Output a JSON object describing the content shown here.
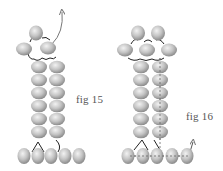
{
  "figures": [
    {
      "id": "fig15",
      "label": "fig 15",
      "description": "Two-column bead ladder with a 3-bead top cluster and 5-bead base row; thread exits upward from top right bead"
    },
    {
      "id": "fig16",
      "label": "fig 16",
      "description": "Two-column bead ladder with a 5-bead top cluster (2 over 3) and 5-bead base row; dashed thread path down right column exits at base right"
    }
  ],
  "colors": {
    "bead_light": "#e6e6e6",
    "bead_mid": "#bdbdbd",
    "bead_dark": "#8f8f8f",
    "thread": "#222222",
    "arrow": "#777777",
    "label": "#555555"
  }
}
